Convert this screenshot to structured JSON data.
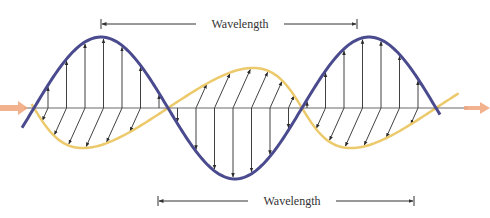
{
  "figure": {
    "labels": {
      "top_wavelength": "Wavelength",
      "bottom_wavelength": "Wavelength"
    },
    "colors": {
      "electric_wave": "#4a4a8f",
      "magnetic_wave": "#ecc96a",
      "axis": "#6b6b6b",
      "vector": "#2b2b2b",
      "propagation_arrow": "#f0a47a",
      "dimension_line": "#333333",
      "background": "#ffffff"
    },
    "axis": {
      "y": 108,
      "x_start": 0,
      "x_end": 490
    },
    "electric_wave": {
      "zero_crossing_x": 34,
      "wavelength_px": 268,
      "amplitude_px": 71,
      "x_start": 22,
      "x_end": 440
    },
    "magnetic_wave": {
      "zero_crossing_x": 34,
      "wavelength_px": 268,
      "amplitude_px": 44,
      "skew_px": 20,
      "x_start": 30,
      "x_end": 452
    },
    "top_dimension": {
      "x1": 101,
      "x2": 357,
      "y": 24,
      "label_x": 240
    },
    "bottom_dimension": {
      "x1": 158,
      "x2": 414,
      "y": 201,
      "label_x": 292
    }
  }
}
